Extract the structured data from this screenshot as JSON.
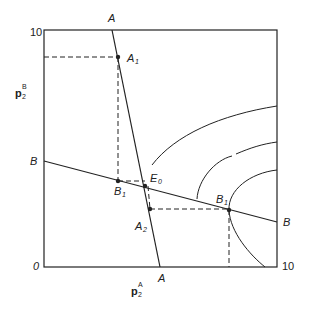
{
  "diagram": {
    "axes": {
      "x_label_main": "p",
      "x_label_sup": "A",
      "x_label_sub": "2",
      "y_label_main": "p",
      "y_label_sup": "B",
      "y_label_sub": "2",
      "origin": "0",
      "x_max": "10",
      "y_max": "10"
    },
    "lines": {
      "A_top": "A",
      "A_bottom": "A",
      "B_left": "B",
      "B_right": "B"
    },
    "points": {
      "A1": {
        "main": "A",
        "sub": "1"
      },
      "A2": {
        "main": "A",
        "sub": "2"
      },
      "B1_left": {
        "main": "B",
        "sub": "1"
      },
      "B1_right": {
        "main": "B",
        "sub": "1"
      },
      "E0": {
        "main": "E",
        "sub": "0"
      }
    },
    "colors": {
      "ink": "#222222",
      "background": "#ffffff"
    }
  }
}
